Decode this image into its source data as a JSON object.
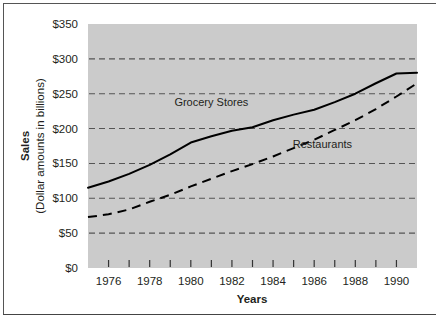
{
  "figure": {
    "background_color": "#ffffff",
    "plot_background_color": "#cbcbcb",
    "frame_color": "#555555"
  },
  "axes": {
    "y_title_bold": "Sales",
    "y_title_sub": "(Dollar amounts in billions)",
    "x_title": "Years",
    "y_ticks": [
      "$0",
      "$50",
      "$100",
      "$150",
      "$200",
      "$250",
      "$300",
      "$350"
    ],
    "x_ticks": [
      "1976",
      "1978",
      "1980",
      "1982",
      "1984",
      "1986",
      "1988",
      "1990"
    ]
  },
  "series_labels": {
    "grocery": "Grocery Stores",
    "restaurants": "Restaurants"
  },
  "chart_data": {
    "type": "line",
    "title": "",
    "xlabel": "Years",
    "ylabel": "Sales (Dollar amounts in billions)",
    "xlim": [
      1975,
      1991
    ],
    "ylim": [
      0,
      350
    ],
    "ytick_values": [
      0,
      50,
      100,
      150,
      200,
      250,
      300,
      350
    ],
    "ytick_labels": [
      "$0",
      "$50",
      "$100",
      "$150",
      "$200",
      "$250",
      "$300",
      "$350"
    ],
    "xtick_values": [
      1975,
      1976,
      1977,
      1978,
      1979,
      1980,
      1981,
      1982,
      1983,
      1984,
      1985,
      1986,
      1987,
      1988,
      1989,
      1990,
      1991
    ],
    "xtick_labeled": [
      1976,
      1978,
      1980,
      1982,
      1984,
      1986,
      1988,
      1990
    ],
    "xtick_labels": [
      "1976",
      "1978",
      "1980",
      "1982",
      "1984",
      "1986",
      "1988",
      "1990"
    ],
    "grid": true,
    "grid_axis": "y",
    "grid_style": "dashed",
    "legend": "inline-annotation",
    "x": [
      1975,
      1976,
      1977,
      1978,
      1979,
      1980,
      1981,
      1982,
      1983,
      1984,
      1985,
      1986,
      1987,
      1988,
      1989,
      1990,
      1991
    ],
    "series": [
      {
        "name": "Grocery Stores",
        "style": "solid",
        "color": "#000000",
        "values": [
          115,
          124,
          135,
          148,
          163,
          180,
          189,
          197,
          202,
          212,
          220,
          227,
          238,
          250,
          265,
          279,
          280
        ]
      },
      {
        "name": "Restaurants",
        "style": "dashed",
        "color": "#000000",
        "values": [
          73,
          77,
          84,
          95,
          105,
          117,
          128,
          139,
          149,
          160,
          172,
          184,
          198,
          212,
          228,
          246,
          265
        ]
      }
    ],
    "annotations": [
      {
        "text": "Grocery Stores",
        "x": 1981.0,
        "y": 232
      },
      {
        "text": "Restaurants",
        "x": 1986.4,
        "y": 172
      }
    ]
  }
}
